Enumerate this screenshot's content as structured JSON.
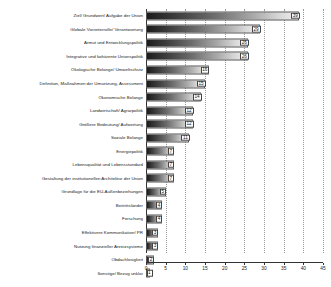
{
  "chart_data": {
    "type": "bar",
    "orientation": "horizontal",
    "title": "",
    "xlabel": "",
    "ylabel": "",
    "xlim": [
      0,
      45
    ],
    "xticks": [
      0,
      5,
      10,
      15,
      20,
      25,
      30,
      35,
      40,
      45
    ],
    "grid": true,
    "legend": "none",
    "bar_style": "grayscale-gradient",
    "value_labels": true,
    "categories": [
      "Ziel/ Grundwert/ Aufgabe der Union",
      "Globale Vorreiterrolle/ Verantwortung",
      "Armut und Entwicklungspolitik",
      "Integrative und kohärente Unionspolitik",
      "Ökologische Belange/ Umweltschutz",
      "Definition, Maßnahmen der Umsetzung, Assessment",
      "Ökonomische Belange",
      "Landwirtschaft/ Agrarpolitik",
      "Größere Bedeutung/ Aufwertung",
      "Soziale Belange",
      "Energiepolitik",
      "Lebensqualität und Lebensstandard",
      "Gestaltung der institutionellen Architektur der Union",
      "Grundlage für die EU-Außenbeziehungen",
      "Beitrittsländer",
      "Forschung",
      "Effektivere Kommunikation/ PR",
      "Nutzung finanzieller Anreizsysteme",
      "Obdachlosigkeit",
      "Sonstige/ Bezug unklar"
    ],
    "values": [
      39,
      29,
      26,
      26,
      16,
      15,
      14,
      12,
      12,
      11,
      7,
      7,
      7,
      5,
      4,
      4,
      3,
      3,
      2,
      1
    ]
  },
  "colors": {
    "bar_dark": "#1c1c1c",
    "bar_light": "#efefef",
    "axis": "#333333",
    "grid": "#9a9a9a",
    "text": "#1a1a1a",
    "background": "#ffffff"
  }
}
